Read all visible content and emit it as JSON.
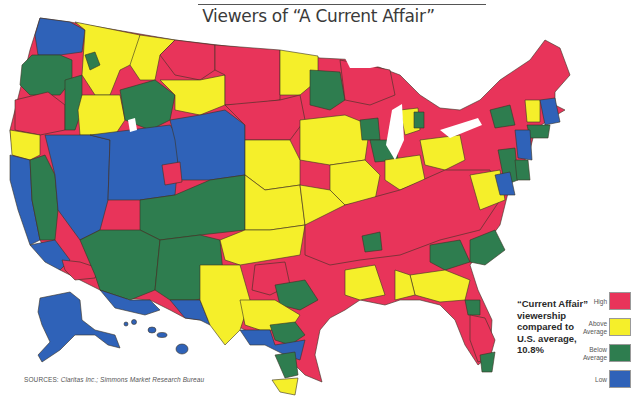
{
  "title": "Viewers of “A Current Affair”",
  "description": {
    "line1": "“Current Affair”",
    "line2": "viewership",
    "line3": "compared to",
    "line4": "U.S. average,",
    "line5": "10.8%"
  },
  "legend": [
    {
      "label": "High",
      "color": "#e8345a"
    },
    {
      "label": "Above Average",
      "color": "#f5ef2a"
    },
    {
      "label": "Below Average",
      "color": "#2e7d4f"
    },
    {
      "label": "Low",
      "color": "#2f62b8"
    }
  ],
  "sources": {
    "prefix": "SOURCES:",
    "text": "Claritas Inc.; Simmons Market Research Bureau"
  },
  "us_average": "10.8%",
  "colors": {
    "high": "#e8345a",
    "above": "#f5ef2a",
    "below": "#2e7d4f",
    "low": "#2f62b8",
    "border": "#3b3324"
  }
}
